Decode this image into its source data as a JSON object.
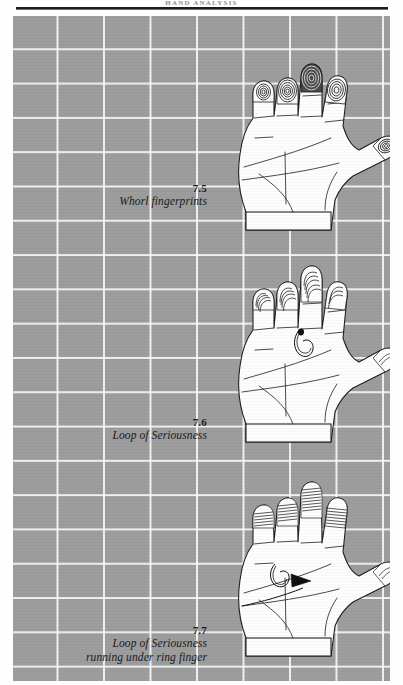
{
  "page": {
    "running_head": "HAND ANALYSIS",
    "background_color": "#9d9d9d",
    "grid_line_color": "#ffffff",
    "ink_color": "#1a1a1a",
    "paper_color": "#fefefe"
  },
  "figures": [
    {
      "number": "7.5",
      "caption_lines": [
        "Whorl fingerprints"
      ],
      "subject": "open right palm with whorl fingerprint patterns on all fingertips and thumb",
      "markings": [
        "whorl-index",
        "whorl-middle",
        "whorl-ring",
        "whorl-little",
        "whorl-thumb"
      ]
    },
    {
      "number": "7.6",
      "caption_lines": [
        "Loop of Seriousness"
      ],
      "subject": "open right palm with loop of seriousness between middle and ring finger",
      "markings": [
        "loop-of-seriousness",
        "loop-fingerprints"
      ]
    },
    {
      "number": "7.7",
      "caption_lines": [
        "Loop of Seriousness",
        "running under ring finger"
      ],
      "subject": "open right palm with loop of seriousness running under the ring finger, arrow indicator",
      "markings": [
        "loop-of-seriousness-under-ring-finger",
        "arrow-indicator"
      ]
    }
  ]
}
